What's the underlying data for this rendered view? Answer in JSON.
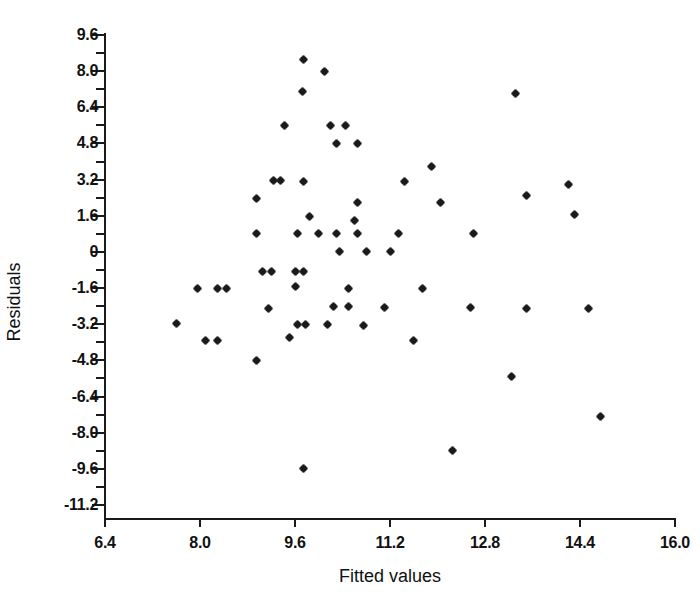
{
  "chart_data": {
    "type": "scatter",
    "title": "",
    "xlabel": "Fitted values",
    "ylabel": "Residuals",
    "xlim": [
      6.4,
      16.0
    ],
    "ylim": [
      -11.2,
      9.6
    ],
    "xticks": [
      6.4,
      8.0,
      9.6,
      11.2,
      12.8,
      14.4,
      16.0
    ],
    "xtick_labels": [
      "6.4",
      "8.0",
      "9.6",
      "11.2",
      "12.8",
      "14.4",
      "16.0"
    ],
    "yticks": [
      9.6,
      8.0,
      6.4,
      4.8,
      3.2,
      1.6,
      0,
      -1.6,
      -3.2,
      -4.8,
      -6.4,
      -8.0,
      -9.6,
      -11.2
    ],
    "ytick_labels": [
      "9.6",
      "8.0",
      "6.4",
      "4.8",
      "3.2",
      "1.6",
      "0",
      "-1.6",
      "-3.2",
      "-4.8",
      "-6.4",
      "-8.0",
      "-9.6",
      "-11.2"
    ],
    "minor_ticks": true,
    "grid": false,
    "legend": null,
    "marker": "asterisk",
    "marker_color": "#1a1a1a",
    "points": [
      [
        9.75,
        8.5
      ],
      [
        10.1,
        8.0
      ],
      [
        9.72,
        7.1
      ],
      [
        13.32,
        7.0
      ],
      [
        9.43,
        5.6
      ],
      [
        10.2,
        5.6
      ],
      [
        10.45,
        5.6
      ],
      [
        10.3,
        4.8
      ],
      [
        10.65,
        4.8
      ],
      [
        11.9,
        3.8
      ],
      [
        9.23,
        3.15
      ],
      [
        9.35,
        3.15
      ],
      [
        9.75,
        3.1
      ],
      [
        11.45,
        3.1
      ],
      [
        13.5,
        2.5
      ],
      [
        14.2,
        3.0
      ],
      [
        8.95,
        2.35
      ],
      [
        10.65,
        2.2
      ],
      [
        12.05,
        2.2
      ],
      [
        9.85,
        1.55
      ],
      [
        10.6,
        1.4
      ],
      [
        14.3,
        1.65
      ],
      [
        8.95,
        0.8
      ],
      [
        9.65,
        0.8
      ],
      [
        10.0,
        0.8
      ],
      [
        10.3,
        0.8
      ],
      [
        10.65,
        0.8
      ],
      [
        11.35,
        0.8
      ],
      [
        12.6,
        0.8
      ],
      [
        10.35,
        0.0
      ],
      [
        10.8,
        0.0
      ],
      [
        11.2,
        0.0
      ],
      [
        9.05,
        -0.85
      ],
      [
        9.2,
        -0.85
      ],
      [
        9.6,
        -0.85
      ],
      [
        9.75,
        -0.85
      ],
      [
        7.95,
        -1.6
      ],
      [
        8.3,
        -1.6
      ],
      [
        8.45,
        -1.6
      ],
      [
        9.6,
        -1.55
      ],
      [
        10.5,
        -1.6
      ],
      [
        11.75,
        -1.6
      ],
      [
        9.15,
        -2.5
      ],
      [
        10.25,
        -2.4
      ],
      [
        10.5,
        -2.4
      ],
      [
        11.1,
        -2.45
      ],
      [
        12.55,
        -2.45
      ],
      [
        13.5,
        -2.5
      ],
      [
        14.55,
        -2.5
      ],
      [
        7.6,
        -3.15
      ],
      [
        9.65,
        -3.2
      ],
      [
        9.78,
        -3.2
      ],
      [
        10.15,
        -3.2
      ],
      [
        10.75,
        -3.25
      ],
      [
        8.1,
        -3.9
      ],
      [
        8.3,
        -3.9
      ],
      [
        9.5,
        -3.8
      ],
      [
        11.6,
        -3.9
      ],
      [
        8.95,
        -4.8
      ],
      [
        13.25,
        -5.5
      ],
      [
        14.75,
        -7.3
      ],
      [
        12.25,
        -8.8
      ],
      [
        9.75,
        -9.6
      ]
    ],
    "n_points": 63
  }
}
